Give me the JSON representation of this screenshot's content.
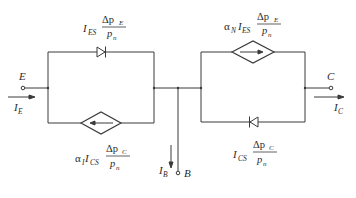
{
  "diagram": {
    "type": "Ebers-Moll equivalent circuit (bipolar transistor)",
    "colors": {
      "line": "#3a3a3a",
      "text": "#2a2a2a",
      "background": "#ffffff"
    },
    "terminals": {
      "emitter": {
        "label": "E",
        "current": "I",
        "current_sub": "E"
      },
      "collector": {
        "label": "C",
        "current": "I",
        "current_sub": "C"
      },
      "base": {
        "label": "B",
        "current": "I",
        "current_sub": "B"
      }
    },
    "elements": {
      "emitter_diode": {
        "coef": "I",
        "coef_sub": "ES",
        "num": "Δp",
        "num_sub": "E",
        "den": "p",
        "den_sub": "n"
      },
      "emitter_source": {
        "alpha": "α",
        "alpha_sub": "I",
        "coef": "I",
        "coef_sub": "CS",
        "num": "Δp",
        "num_sub": "C",
        "den": "p",
        "den_sub": "n"
      },
      "collector_source": {
        "alpha": "α",
        "alpha_sub": "N",
        "coef": "I",
        "coef_sub": "ES",
        "num": "Δp",
        "num_sub": "E",
        "den": "p",
        "den_sub": "n"
      },
      "collector_diode": {
        "coef": "I",
        "coef_sub": "CS",
        "num": "Δp",
        "num_sub": "C",
        "den": "p",
        "den_sub": "n"
      }
    }
  }
}
